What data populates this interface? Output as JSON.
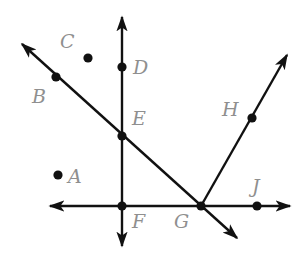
{
  "diagram": {
    "type": "geometry",
    "colors": {
      "line": "#111111",
      "point": "#111111",
      "label": "#8f8f8f",
      "background": "#ffffff"
    },
    "points": [
      {
        "name": "A",
        "x": 58,
        "y": 175,
        "lx": 68,
        "ly": 183
      },
      {
        "name": "B",
        "x": 56,
        "y": 77,
        "lx": 32,
        "ly": 103
      },
      {
        "name": "C",
        "x": 88,
        "y": 58,
        "lx": 60,
        "ly": 48
      },
      {
        "name": "D",
        "x": 122,
        "y": 67,
        "lx": 133,
        "ly": 74
      },
      {
        "name": "E",
        "x": 122,
        "y": 136,
        "lx": 132,
        "ly": 125
      },
      {
        "name": "F",
        "x": 122,
        "y": 206,
        "lx": 132,
        "ly": 228
      },
      {
        "name": "G",
        "x": 201,
        "y": 206,
        "lx": 174,
        "ly": 228
      },
      {
        "name": "H",
        "x": 252,
        "y": 118,
        "lx": 222,
        "ly": 116
      },
      {
        "name": "J",
        "x": 257,
        "y": 206,
        "lx": 252,
        "ly": 193
      }
    ],
    "lines": [
      {
        "id": "line-DF",
        "kind": "line",
        "through": [
          "D",
          "E",
          "F"
        ],
        "x1": 122,
        "y1": 17,
        "x2": 122,
        "y2": 246
      },
      {
        "id": "line-FJ",
        "kind": "line",
        "through": [
          "F",
          "G",
          "J"
        ],
        "x1": 50,
        "y1": 206,
        "x2": 290,
        "y2": 206
      },
      {
        "id": "line-BG",
        "kind": "line",
        "through": [
          "B",
          "E",
          "G"
        ],
        "x1": 22,
        "y1": 44,
        "x2": 237,
        "y2": 238
      },
      {
        "id": "ray-GH",
        "kind": "ray",
        "through": [
          "G",
          "H"
        ],
        "x1": 201,
        "y1": 206,
        "x2": 287,
        "y2": 55
      }
    ]
  }
}
